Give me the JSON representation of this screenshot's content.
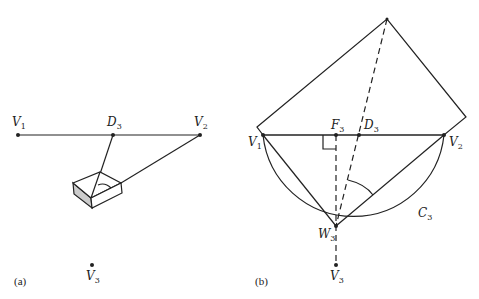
{
  "panel_a": {
    "caption": "(a)",
    "labels": {
      "V1": "V",
      "V1_sub": "1",
      "D3": "D",
      "D3_sub": "3",
      "V2": "V",
      "V2_sub": "2",
      "V3": "V",
      "V3_sub": "3"
    }
  },
  "panel_b": {
    "caption": "(b)",
    "labels": {
      "V1": "V",
      "V1_sub": "1",
      "F3": "F",
      "F3_sub": "3",
      "D3": "D",
      "D3_sub": "3",
      "V2": "V",
      "V2_sub": "2",
      "W3": "W",
      "W3_sub": "3",
      "V3": "V",
      "V3_sub": "3",
      "C3": "C",
      "C3_sub": "3"
    }
  },
  "colors": {
    "stroke": "#222222",
    "box_side": "#cccccc"
  }
}
